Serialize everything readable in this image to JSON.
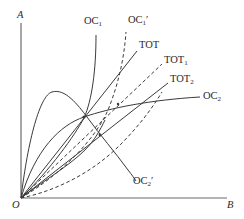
{
  "diagram": {
    "type": "offer-curve-diagram",
    "axes": {
      "y_axis_label": "A",
      "x_axis_label": "B",
      "origin_label": "O"
    },
    "curves": [
      {
        "id": "OC1",
        "label_main": "OC",
        "label_sub": "1",
        "label_prime": "",
        "style": "solid"
      },
      {
        "id": "OC1prime",
        "label_main": "OC",
        "label_sub": "1",
        "label_prime": "′",
        "style": "dashed"
      },
      {
        "id": "TOT",
        "label_main": "TOT",
        "label_sub": "",
        "label_prime": "",
        "style": "solid"
      },
      {
        "id": "TOT1",
        "label_main": "TOT",
        "label_sub": "1",
        "label_prime": "",
        "style": "dashed"
      },
      {
        "id": "TOT2",
        "label_main": "TOT",
        "label_sub": "2",
        "label_prime": "",
        "style": "solid"
      },
      {
        "id": "OC2",
        "label_main": "OC",
        "label_sub": "2",
        "label_prime": "",
        "style": "solid"
      },
      {
        "id": "OC2prime",
        "label_main": "OC",
        "label_sub": "2",
        "label_prime": "′",
        "style": "solid"
      }
    ],
    "colors": {
      "line": "#3a3a3a",
      "axis": "#6a6a6a",
      "text": "#2a2a2a",
      "background": "#ffffff"
    }
  }
}
